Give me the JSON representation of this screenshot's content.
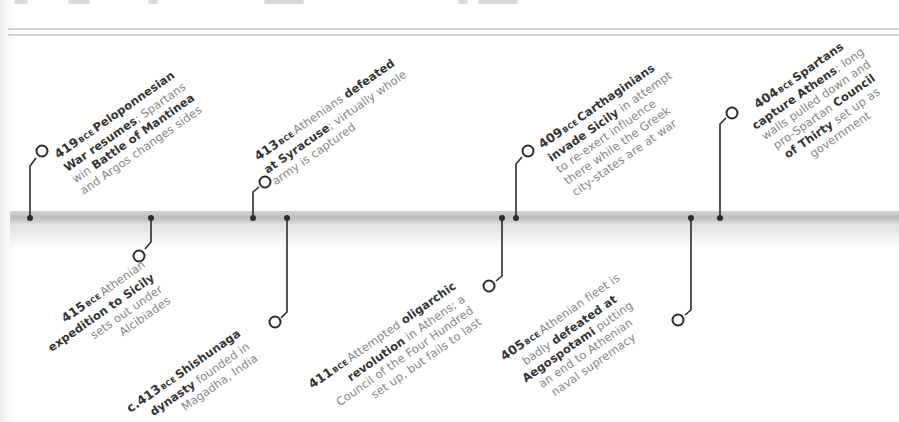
{
  "page": {
    "type": "timeline-spread"
  },
  "colors": {
    "marker": "#2b2b2b",
    "band": "#c4c4c4",
    "text_bold": "#333333",
    "text_light": "#858585"
  },
  "timeline": {
    "era_label": "BCE",
    "events": [
      {
        "id": "e419",
        "position": "above",
        "year": "419",
        "lines": [
          [
            {
              "t": "Peloponnesian",
              "b": true
            }
          ],
          [
            {
              "t": "War resumes",
              "b": true
            },
            {
              "t": "; Spartans",
              "b": false
            }
          ],
          [
            {
              "t": "win ",
              "b": false
            },
            {
              "t": "Battle of Mantinea",
              "b": true
            }
          ],
          [
            {
              "t": "and Argos changes sides",
              "b": false
            }
          ]
        ]
      },
      {
        "id": "e415",
        "position": "below",
        "year": "415",
        "lines": [
          [
            {
              "t": "Athenian",
              "b": false
            }
          ],
          [
            {
              "t": "expedition to Sicily",
              "b": true
            }
          ],
          [
            {
              "t": "sets out under",
              "b": false
            }
          ],
          [
            {
              "t": "Alcibiades",
              "b": false
            }
          ]
        ]
      },
      {
        "id": "e413a",
        "position": "above",
        "year": "413",
        "lines": [
          [
            {
              "t": "Athenians ",
              "b": false
            },
            {
              "t": "defeated",
              "b": true
            }
          ],
          [
            {
              "t": "at Syracuse",
              "b": true
            },
            {
              "t": "; virtually whole",
              "b": false
            }
          ],
          [
            {
              "t": "army is captured",
              "b": false
            }
          ]
        ]
      },
      {
        "id": "e413b",
        "position": "below",
        "year": "c.413",
        "lines": [
          [
            {
              "t": "Shishunaga",
              "b": true
            }
          ],
          [
            {
              "t": "dynasty",
              "b": true
            },
            {
              "t": " founded in",
              "b": false
            }
          ],
          [
            {
              "t": "Magadha, India",
              "b": false
            }
          ]
        ]
      },
      {
        "id": "e411",
        "position": "below",
        "year": "411",
        "lines": [
          [
            {
              "t": "Attempted ",
              "b": false
            },
            {
              "t": "oligarchic",
              "b": true
            }
          ],
          [
            {
              "t": "revolution",
              "b": true
            },
            {
              "t": " in Athens; a",
              "b": false
            }
          ],
          [
            {
              "t": "Council of the Four Hundred",
              "b": false
            }
          ],
          [
            {
              "t": "set up, but fails to last",
              "b": false
            }
          ]
        ]
      },
      {
        "id": "e409",
        "position": "above",
        "year": "409",
        "lines": [
          [
            {
              "t": "Carthaginians",
              "b": true
            }
          ],
          [
            {
              "t": "invade Sicily",
              "b": true
            },
            {
              "t": " in attempt",
              "b": false
            }
          ],
          [
            {
              "t": "to re-exert influence",
              "b": false
            }
          ],
          [
            {
              "t": "there while the Greek",
              "b": false
            }
          ],
          [
            {
              "t": "city-states are at war",
              "b": false
            }
          ]
        ]
      },
      {
        "id": "e405",
        "position": "below",
        "year": "405",
        "lines": [
          [
            {
              "t": "Athenian fleet is",
              "b": false
            }
          ],
          [
            {
              "t": "badly ",
              "b": false
            },
            {
              "t": "defeated at",
              "b": true
            }
          ],
          [
            {
              "t": "Aegospotami",
              "b": true
            },
            {
              "t": " putting",
              "b": false
            }
          ],
          [
            {
              "t": "an end to Athenian",
              "b": false
            }
          ],
          [
            {
              "t": "naval supremacy",
              "b": false
            }
          ]
        ]
      },
      {
        "id": "e404",
        "position": "above",
        "year": "404",
        "lines": [
          [
            {
              "t": "Spartans",
              "b": true
            }
          ],
          [
            {
              "t": "capture Athens",
              "b": true
            },
            {
              "t": "; long",
              "b": false
            }
          ],
          [
            {
              "t": "walls pulled down and",
              "b": false
            }
          ],
          [
            {
              "t": "pro-Spartan ",
              "b": false
            },
            {
              "t": "Council",
              "b": true
            }
          ],
          [
            {
              "t": "of Thirty",
              "b": true
            },
            {
              "t": " set up as",
              "b": false
            }
          ],
          [
            {
              "t": "government",
              "b": false
            }
          ]
        ]
      }
    ]
  }
}
